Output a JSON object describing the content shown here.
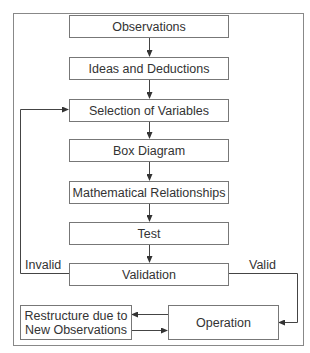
{
  "diagram": {
    "nodes": [
      {
        "id": "observations",
        "label": "Observations"
      },
      {
        "id": "ideas",
        "label": "Ideas and Deductions"
      },
      {
        "id": "selection",
        "label": "Selection of Variables"
      },
      {
        "id": "box_diagram",
        "label": "Box Diagram"
      },
      {
        "id": "math",
        "label": "Mathematical Relationships"
      },
      {
        "id": "test",
        "label": "Test"
      },
      {
        "id": "validation",
        "label": "Validation"
      },
      {
        "id": "restructure",
        "label": "Restructure due to New Observations"
      },
      {
        "id": "operation",
        "label": "Operation"
      }
    ],
    "edges": [
      {
        "from": "observations",
        "to": "ideas"
      },
      {
        "from": "ideas",
        "to": "selection"
      },
      {
        "from": "selection",
        "to": "box_diagram"
      },
      {
        "from": "box_diagram",
        "to": "math"
      },
      {
        "from": "math",
        "to": "test"
      },
      {
        "from": "test",
        "to": "validation"
      },
      {
        "from": "validation",
        "to": "selection",
        "label": "Invalid"
      },
      {
        "from": "validation",
        "to": "operation",
        "label": "Valid"
      },
      {
        "from": "operation",
        "to": "restructure"
      },
      {
        "from": "restructure",
        "to": "operation"
      }
    ],
    "edge_labels": {
      "invalid": "Invalid",
      "valid": "Valid"
    },
    "colors": {
      "line": "#555555",
      "border": "#777777",
      "text": "#333333"
    }
  }
}
